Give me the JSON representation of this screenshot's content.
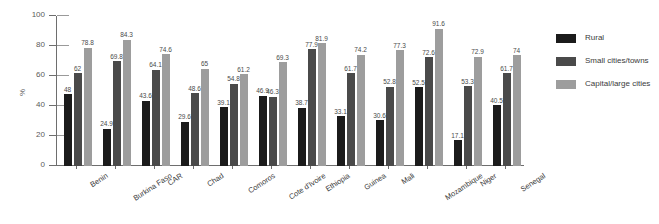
{
  "chart_data": {
    "type": "bar",
    "title": "",
    "xlabel": "",
    "ylabel": "%",
    "ylim": [
      0,
      100
    ],
    "yticks": [
      0,
      20,
      40,
      60,
      80,
      100
    ],
    "grid": false,
    "legend_position": "right",
    "categories": [
      "Benin",
      "Burkina Faso",
      "CAR",
      "Chad",
      "Comoros",
      "Cote d'Ivoire",
      "Ethiopia",
      "Guinea",
      "Mali",
      "Mozambique",
      "Niger",
      "Senegal"
    ],
    "series": [
      {
        "name": "Rural",
        "color": "#1b1b1b",
        "values": [
          48,
          24.9,
          43.6,
          29.6,
          39.1,
          46.9,
          38.7,
          33.1,
          30.6,
          52.5,
          17.1,
          40.5
        ]
      },
      {
        "name": "Small cities/towns",
        "color": "#4a4a4a",
        "values": [
          62,
          69.8,
          64.1,
          48.6,
          54.8,
          46.3,
          77.9,
          61.7,
          52.8,
          72.6,
          53.3,
          61.7
        ]
      },
      {
        "name": "Capital/large cities",
        "color": "#9d9d9d",
        "values": [
          78.8,
          84.3,
          74.6,
          65,
          61.2,
          69.3,
          81.9,
          74.2,
          77.3,
          91.6,
          72.9,
          74
        ]
      }
    ]
  }
}
